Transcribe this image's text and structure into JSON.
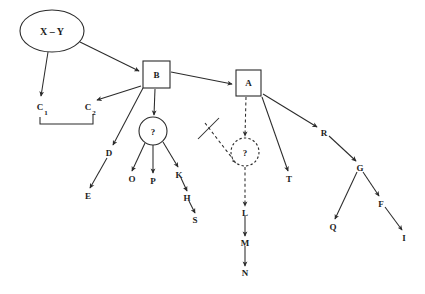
{
  "diagram": {
    "canvas": {
      "width": 425,
      "height": 294,
      "background": "#ffffff"
    },
    "stroke_color": "#2b2b2b",
    "text_color": "#1c1c1c",
    "nodes": {
      "xy": {
        "label": "X – Y",
        "shape": "ellipse",
        "cx": 52,
        "cy": 31,
        "rx": 32,
        "ry": 21
      },
      "b": {
        "label": "B",
        "shape": "box",
        "x": 143,
        "y": 61,
        "w": 27,
        "h": 27
      },
      "a": {
        "label": "A",
        "shape": "box",
        "x": 236,
        "y": 70,
        "w": 25,
        "h": 26
      },
      "q_solid": {
        "label": "?",
        "shape": "circle",
        "cx": 153,
        "cy": 131,
        "r": 14
      },
      "q_dashed": {
        "label": "?",
        "shape": "circle-dashed",
        "cx": 245,
        "cy": 152,
        "r": 14
      },
      "c1": {
        "label": "C",
        "sub": "1",
        "x": 40,
        "y": 106
      },
      "c2": {
        "label": "C",
        "sub": "2",
        "x": 88,
        "y": 106
      },
      "d": {
        "label": "D",
        "x": 109,
        "y": 153
      },
      "e": {
        "label": "E",
        "x": 88,
        "y": 196
      },
      "o": {
        "label": "O",
        "x": 132,
        "y": 179
      },
      "p": {
        "label": "P",
        "x": 153,
        "y": 181
      },
      "k": {
        "label": "K",
        "x": 179,
        "y": 175
      },
      "h": {
        "label": "H",
        "x": 187,
        "y": 198
      },
      "s": {
        "label": "S",
        "x": 195,
        "y": 220
      },
      "l": {
        "label": "L",
        "x": 245,
        "y": 213
      },
      "m": {
        "label": "M",
        "x": 245,
        "y": 243
      },
      "n": {
        "label": "N",
        "x": 245,
        "y": 273
      },
      "t": {
        "label": "T",
        "x": 289,
        "y": 179
      },
      "r": {
        "label": "R",
        "x": 324,
        "y": 133
      },
      "g": {
        "label": "G",
        "x": 360,
        "y": 168
      },
      "q": {
        "label": "Q",
        "x": 333,
        "y": 227
      },
      "f": {
        "label": "F",
        "x": 381,
        "y": 204
      },
      "i": {
        "label": "I",
        "x": 404,
        "y": 238
      }
    },
    "edges": [
      {
        "name": "edge-xy-to-c1",
        "from": "xy",
        "to": "c1",
        "style": "solid",
        "arrow": true
      },
      {
        "name": "edge-xy-to-b",
        "from": "xy",
        "to": "b",
        "style": "solid",
        "arrow": true
      },
      {
        "name": "edge-b-to-c2",
        "from": "b",
        "to": "c2",
        "style": "solid",
        "arrow": true
      },
      {
        "name": "edge-b-to-d",
        "from": "b",
        "to": "d",
        "style": "solid",
        "arrow": true
      },
      {
        "name": "edge-b-to-qsolid",
        "from": "b",
        "to": "q_solid",
        "style": "solid",
        "arrow": true
      },
      {
        "name": "edge-b-to-a",
        "from": "b",
        "to": "a",
        "style": "solid",
        "arrow": true
      },
      {
        "name": "edge-d-to-e",
        "from": "d",
        "to": "e",
        "style": "solid",
        "arrow": true
      },
      {
        "name": "edge-qsolid-to-o",
        "from": "q_solid",
        "to": "o",
        "style": "solid",
        "arrow": true
      },
      {
        "name": "edge-qsolid-to-p",
        "from": "q_solid",
        "to": "p",
        "style": "solid",
        "arrow": true
      },
      {
        "name": "edge-qsolid-to-k",
        "from": "q_solid",
        "to": "k",
        "style": "solid",
        "arrow": true
      },
      {
        "name": "edge-k-to-h",
        "from": "k",
        "to": "h",
        "style": "solid",
        "arrow": true
      },
      {
        "name": "edge-h-to-s",
        "from": "h",
        "to": "s",
        "style": "solid",
        "arrow": true
      },
      {
        "name": "edge-a-to-qdashed",
        "from": "a",
        "to": "q_dashed",
        "style": "dashed",
        "arrow": true
      },
      {
        "name": "edge-a-to-t",
        "from": "a",
        "to": "t",
        "style": "solid",
        "arrow": true
      },
      {
        "name": "edge-a-to-r",
        "from": "a",
        "to": "r",
        "style": "solid",
        "arrow": true
      },
      {
        "name": "edge-qdashed-to-l",
        "from": "q_dashed",
        "to": "l",
        "style": "dashed",
        "arrow": true
      },
      {
        "name": "edge-blocked-to-qdashed",
        "from": "cut-source",
        "to": "q_dashed",
        "style": "dashed",
        "arrow": true,
        "blocked": true
      },
      {
        "name": "edge-l-to-m",
        "from": "l",
        "to": "m",
        "style": "solid",
        "arrow": true
      },
      {
        "name": "edge-m-to-n",
        "from": "m",
        "to": "n",
        "style": "solid",
        "arrow": true
      },
      {
        "name": "edge-r-to-g",
        "from": "r",
        "to": "g",
        "style": "solid",
        "arrow": true
      },
      {
        "name": "edge-g-to-q",
        "from": "g",
        "to": "q",
        "style": "solid",
        "arrow": true
      },
      {
        "name": "edge-g-to-f",
        "from": "g",
        "to": "f",
        "style": "solid",
        "arrow": true
      },
      {
        "name": "edge-f-to-i",
        "from": "f",
        "to": "i",
        "style": "solid",
        "arrow": true
      }
    ],
    "annotations": {
      "c_bracket": {
        "name": "c1-c2-bracket",
        "description": "U-shaped bracket joining C1 and C2"
      },
      "cut_mark": {
        "name": "link-cut-mark",
        "description": "Perpendicular stroke crossing the incoming dashed link"
      }
    }
  }
}
